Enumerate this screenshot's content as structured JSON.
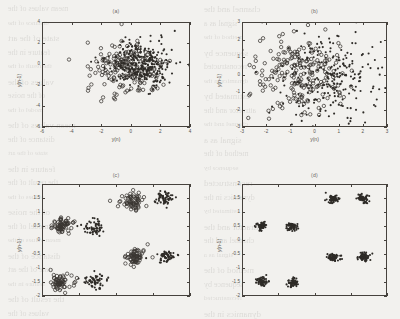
{
  "figure": {
    "caption_kind": "four-panel-scatter",
    "background_hex": "#f2f1ee",
    "ink_hex": "#2e2b27",
    "bleed_text": [
      "mean values of the",
      "channel and the",
      "distance of the",
      "signal as a",
      "state of the art",
      "method of the",
      "feature in the",
      "sequence by",
      "the result of the",
      "reconstructed",
      "values of the",
      "dynamics in the",
      "of the noise",
      "estimated by",
      "model of the",
      "attractor and the"
    ]
  },
  "panels": [
    {
      "id": "a",
      "title": "(a)",
      "xlabel": "y(n)",
      "ylabel": "y(n-1)",
      "xlim": [
        -6,
        4
      ],
      "ylim": [
        -6,
        4
      ],
      "xticks": [
        -6,
        -4,
        -2,
        0,
        2,
        4
      ],
      "yticks": [
        -6,
        -4,
        -2,
        0,
        2,
        4
      ],
      "xticklabels": [
        "-6",
        "-4",
        "-2",
        "0",
        "2",
        "4"
      ],
      "yticklabels": [
        "-6",
        "-4",
        "-2",
        "0",
        "2",
        "4"
      ],
      "series": [
        {
          "name": "class-open-circle",
          "marker": "open-circle",
          "n": 170,
          "center": [
            -0.35,
            -0.35
          ],
          "spread": [
            1.25,
            1.35
          ]
        },
        {
          "name": "class-filled-dot",
          "marker": "filled-dot",
          "n": 330,
          "center": [
            0.55,
            0.1
          ],
          "spread": [
            1.0,
            1.05
          ]
        }
      ]
    },
    {
      "id": "b",
      "title": "(b)",
      "xlabel": "y(n)",
      "ylabel": "y(n-1)",
      "xlim": [
        -3,
        3
      ],
      "ylim": [
        -3,
        3
      ],
      "xticks": [
        -3,
        -2,
        -1,
        0,
        1,
        2,
        3
      ],
      "yticks": [
        -3,
        -2,
        -1,
        0,
        1,
        2,
        3
      ],
      "xticklabels": [
        "-3",
        "-2",
        "-1",
        "0",
        "1",
        "2",
        "3"
      ],
      "yticklabels": [
        "-3",
        "-2",
        "-1",
        "0",
        "1",
        "2",
        "3"
      ],
      "series": [
        {
          "name": "class-open-circle",
          "marker": "open-circle",
          "n": 210,
          "center": [
            -0.75,
            0.15
          ],
          "spread": [
            1.0,
            1.15
          ]
        },
        {
          "name": "class-filled-dot",
          "marker": "filled-dot",
          "n": 250,
          "center": [
            0.6,
            -0.15
          ],
          "spread": [
            1.05,
            1.2
          ]
        }
      ]
    },
    {
      "id": "c",
      "title": "(c)",
      "xlabel": "",
      "ylabel": "y(n-1)",
      "xlim": [
        -2,
        2
      ],
      "ylim": [
        -2,
        2
      ],
      "xticks": [
        -2,
        -1,
        0,
        1,
        2
      ],
      "yticks": [
        -2,
        -1.5,
        -1,
        -0.5,
        0,
        0.5,
        1,
        1.5,
        2
      ],
      "xticklabels": [
        "",
        "",
        "",
        "",
        ""
      ],
      "yticklabels": [
        "-2",
        "-1.5",
        "-1",
        "-0.5",
        "0",
        "0.5",
        "1",
        "1.5",
        "2"
      ],
      "clusters": [
        {
          "marker": "open-circle",
          "center": [
            -1.45,
            0.5
          ],
          "n": 62,
          "spread": [
            0.14,
            0.13
          ]
        },
        {
          "marker": "filled-dot",
          "center": [
            -0.62,
            0.45
          ],
          "n": 62,
          "spread": [
            0.15,
            0.14
          ]
        },
        {
          "marker": "open-circle",
          "center": [
            0.45,
            1.4
          ],
          "n": 62,
          "spread": [
            0.16,
            0.14
          ]
        },
        {
          "marker": "filled-dot",
          "center": [
            1.3,
            1.5
          ],
          "n": 62,
          "spread": [
            0.15,
            0.13
          ]
        },
        {
          "marker": "open-circle",
          "center": [
            -1.45,
            -1.5
          ],
          "n": 62,
          "spread": [
            0.15,
            0.14
          ]
        },
        {
          "marker": "filled-dot",
          "center": [
            -0.58,
            -1.45
          ],
          "n": 62,
          "spread": [
            0.15,
            0.13
          ]
        },
        {
          "marker": "open-circle",
          "center": [
            0.5,
            -0.62
          ],
          "n": 62,
          "spread": [
            0.15,
            0.14
          ]
        },
        {
          "marker": "filled-dot",
          "center": [
            1.35,
            -0.62
          ],
          "n": 62,
          "spread": [
            0.15,
            0.13
          ]
        }
      ]
    },
    {
      "id": "d",
      "title": "(d)",
      "xlabel": "",
      "ylabel": "y(n-1)",
      "xlim": [
        -2,
        2
      ],
      "ylim": [
        -2,
        2
      ],
      "xticks": [
        -2,
        -1,
        0,
        1,
        2
      ],
      "yticks": [
        -2,
        -1.5,
        -1,
        -0.5,
        0,
        0.5,
        1,
        1.5,
        2
      ],
      "xticklabels": [
        "",
        "",
        "",
        "",
        ""
      ],
      "yticklabels": [
        "-2",
        "-1.5",
        "-1",
        "-0.5",
        "0",
        "0.5",
        "1",
        "1.5",
        "2"
      ],
      "clusters": [
        {
          "marker": "filled-dot",
          "center": [
            -1.45,
            0.5
          ],
          "n": 62,
          "spread": [
            0.075,
            0.07
          ]
        },
        {
          "marker": "filled-dot",
          "center": [
            -0.62,
            0.5
          ],
          "n": 62,
          "spread": [
            0.08,
            0.075
          ]
        },
        {
          "marker": "filled-dot",
          "center": [
            0.5,
            1.45
          ],
          "n": 62,
          "spread": [
            0.08,
            0.07
          ]
        },
        {
          "marker": "filled-dot",
          "center": [
            1.35,
            1.5
          ],
          "n": 62,
          "spread": [
            0.075,
            0.075
          ]
        },
        {
          "marker": "filled-dot",
          "center": [
            -1.45,
            -1.5
          ],
          "n": 62,
          "spread": [
            0.075,
            0.07
          ]
        },
        {
          "marker": "filled-dot",
          "center": [
            -0.6,
            -1.52
          ],
          "n": 62,
          "spread": [
            0.08,
            0.07
          ]
        },
        {
          "marker": "filled-dot",
          "center": [
            0.52,
            -0.62
          ],
          "n": 62,
          "spread": [
            0.08,
            0.07
          ]
        },
        {
          "marker": "filled-dot",
          "center": [
            1.38,
            -0.6
          ],
          "n": 62,
          "spread": [
            0.08,
            0.075
          ]
        }
      ]
    }
  ],
  "chart_data": {
    "type": "scatter",
    "title": "",
    "subplots": 4,
    "subplot_titles": [
      "(a)",
      "(b)",
      "(c)",
      "(d)"
    ],
    "xlabel": "y(n)",
    "ylabel": "y(n-1)",
    "legend": [],
    "grid": false,
    "markers": [
      "open-circle",
      "filled-dot"
    ],
    "axes": [
      {
        "panel": "(a)",
        "xlim": [
          -6,
          4
        ],
        "ylim": [
          -6,
          4
        ],
        "xticks": [
          -6,
          -4,
          -2,
          0,
          2,
          4
        ],
        "yticks": [
          -6,
          -4,
          -2,
          0,
          2,
          4
        ]
      },
      {
        "panel": "(b)",
        "xlim": [
          -3,
          3
        ],
        "ylim": [
          -3,
          3
        ],
        "xticks": [
          -3,
          -2,
          -1,
          0,
          1,
          2,
          3
        ],
        "yticks": [
          -3,
          -2,
          -1,
          0,
          1,
          2,
          3
        ]
      },
      {
        "panel": "(c)",
        "xlim": [
          -2,
          2
        ],
        "ylim": [
          -2,
          2
        ],
        "xticks": [
          -2,
          -1,
          0,
          1,
          2
        ],
        "yticks": [
          -2,
          -1.5,
          -1,
          -0.5,
          0,
          0.5,
          1,
          1.5,
          2
        ]
      },
      {
        "panel": "(d)",
        "xlim": [
          -2,
          2
        ],
        "ylim": [
          -2,
          2
        ],
        "xticks": [
          -2,
          -1,
          0,
          1,
          2
        ],
        "yticks": [
          -2,
          -1.5,
          -1,
          -0.5,
          0,
          0.5,
          1,
          1.5,
          2
        ]
      }
    ]
  }
}
